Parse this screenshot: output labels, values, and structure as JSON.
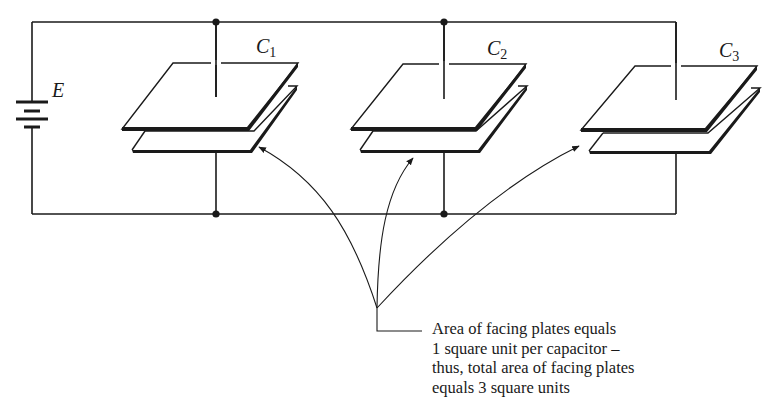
{
  "diagram": {
    "source": {
      "label": "E",
      "type": "battery"
    },
    "capacitors": [
      {
        "name": "C",
        "subscript": "1"
      },
      {
        "name": "C",
        "subscript": "2"
      },
      {
        "name": "C",
        "subscript": "3"
      }
    ],
    "annotation": {
      "lines": [
        "Area of facing plates equals",
        "1 square unit per capacitor –",
        "thus, total area of facing plates",
        "equals 3 square units"
      ]
    },
    "colors": {
      "ink": "#1a1a1a",
      "background": "#ffffff"
    }
  }
}
